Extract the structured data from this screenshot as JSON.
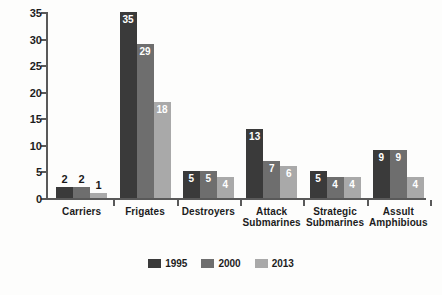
{
  "chart_data": {
    "type": "bar",
    "title": "",
    "subtitle": "",
    "xlabel": "",
    "ylabel": "",
    "ylim": [
      0,
      35
    ],
    "yticks": [
      0,
      5,
      10,
      15,
      20,
      25,
      30,
      35
    ],
    "grid": false,
    "legend_position": "bottom",
    "categories": [
      "Carriers",
      "Frigates",
      "Destroyers",
      "Attack Submarines",
      "Strategic Submarines",
      "Assult Amphibious"
    ],
    "category_lines": [
      [
        "Carriers"
      ],
      [
        "Frigates"
      ],
      [
        "Destroyers"
      ],
      [
        "Attack",
        "Submarines"
      ],
      [
        "Strategic",
        "Submarines"
      ],
      [
        "Assult",
        "Amphibious"
      ]
    ],
    "series": [
      {
        "name": "1995",
        "color": "#3a3a3a",
        "values": [
          2,
          35,
          5,
          13,
          5,
          9
        ]
      },
      {
        "name": "2000",
        "color": "#6e6e6e",
        "values": [
          2,
          29,
          5,
          7,
          4,
          9
        ]
      },
      {
        "name": "2013",
        "color": "#a9a9a9",
        "values": [
          1,
          18,
          4,
          6,
          4,
          4
        ]
      }
    ]
  },
  "axis": {
    "tick_labels": [
      "0",
      "5",
      "10",
      "15",
      "20",
      "25",
      "30",
      "35"
    ]
  },
  "legend": {
    "items": [
      {
        "label": "1995",
        "color": "#3a3a3a"
      },
      {
        "label": "2000",
        "color": "#6e6e6e"
      },
      {
        "label": "2013",
        "color": "#a9a9a9"
      }
    ]
  }
}
